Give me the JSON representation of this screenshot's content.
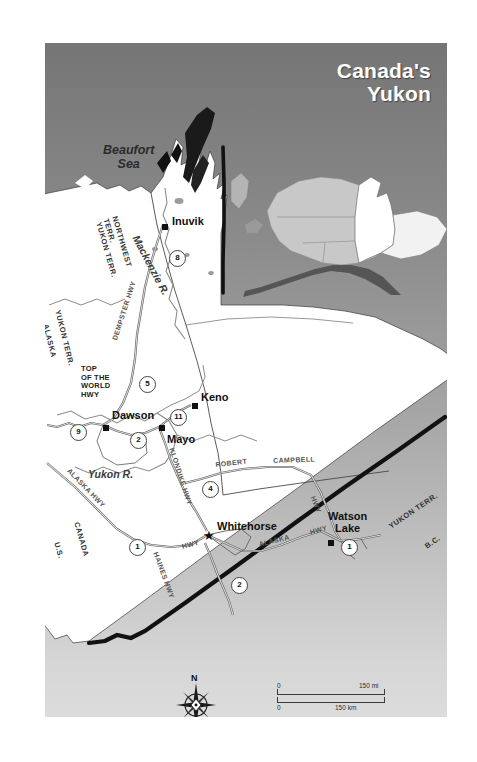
{
  "title": "Canada's\nYukon",
  "map": {
    "water_labels": [
      {
        "name": "beaufort-sea",
        "text": "Beaufort\nSea",
        "x": 58,
        "y": 100
      },
      {
        "name": "yukon-river",
        "text": "Yukon R.",
        "x": 43,
        "y": 425
      },
      {
        "name": "mackenzie-river",
        "text": "Mackenzie R.",
        "x": 96,
        "y": 190
      }
    ],
    "cities": [
      {
        "name": "inuvik",
        "label": "Inuvik",
        "marker": "square",
        "lx": 122,
        "ly": 165,
        "mx": 117,
        "my": 181
      },
      {
        "name": "dawson",
        "label": "Dawson",
        "marker": "square",
        "lx": 62,
        "ly": 366,
        "mx": 58,
        "my": 382
      },
      {
        "name": "keno",
        "label": "Keno",
        "marker": "square",
        "lx": 152,
        "ly": 352,
        "mx": 147,
        "my": 360
      },
      {
        "name": "mayo",
        "label": "Mayo",
        "marker": "square",
        "lx": 131,
        "ly": 391,
        "mx": 114,
        "my": 382
      },
      {
        "name": "whitehorse",
        "label": "Whitehorse",
        "marker": "star",
        "lx": 178,
        "ly": 484,
        "mx": 164,
        "my": 492
      },
      {
        "name": "watson-lake",
        "label": "Watson\nLake",
        "marker": "square",
        "lx": 288,
        "ly": 473,
        "mx": 283,
        "my": 497
      }
    ],
    "highway_labels": [
      {
        "name": "dempster-hwy",
        "text": "DEMPSTER HWY",
        "x": 68,
        "y": 300,
        "rot": -72
      },
      {
        "name": "top-of-the-world-hwy",
        "text": "TOP\nOF THE\nWORLD\nHWY",
        "x": 38,
        "y": 325,
        "rot": 0
      },
      {
        "name": "klondike-hwy",
        "text": "KLONDIKE HWY",
        "x": 136,
        "y": 430,
        "rot": 72
      },
      {
        "name": "alaska-hwy-west",
        "text": "ALASKA HWY",
        "x": 30,
        "y": 470,
        "rot": 52
      },
      {
        "name": "haines-hwy",
        "text": "HAINES HWY",
        "x": 119,
        "y": 516,
        "rot": 74
      },
      {
        "name": "robert-hwy",
        "text": "ROBERT",
        "x": 180,
        "y": 422,
        "rot": -8
      },
      {
        "name": "campbell-hwy",
        "text": "CAMPBELL",
        "x": 238,
        "y": 421,
        "rot": -4
      },
      {
        "name": "campbell-hwy-tail",
        "text": "HWY",
        "x": 272,
        "y": 470,
        "rot": 68
      },
      {
        "name": "alaska-hwy-south",
        "text": "ALASKA",
        "x": 217,
        "y": 503,
        "rot": 14
      },
      {
        "name": "alaska-hwy-east",
        "text": "HWY",
        "x": 266,
        "y": 489,
        "rot": 20
      },
      {
        "name": "alaska-hwy-whitehorse",
        "text": "HWY",
        "x": 139,
        "y": 503,
        "rot": 16
      }
    ],
    "border_labels": [
      {
        "name": "alaska-border",
        "text": "ALASKA",
        "x": 5,
        "y": 282,
        "rot": 74
      },
      {
        "name": "yukon-terr-west",
        "text": "YUKON TERR.",
        "x": 18,
        "y": 270,
        "rot": 74
      },
      {
        "name": "northwest-terr",
        "text": "NORTHWEST\nTERR.",
        "x": 73,
        "y": 175,
        "rot": 74
      },
      {
        "name": "yukon-terr-north",
        "text": "YUKON TERR.",
        "x": 58,
        "y": 180,
        "rot": 74
      },
      {
        "name": "us-border",
        "text": "U.S.",
        "x": 17,
        "y": 500,
        "rot": 74
      },
      {
        "name": "canada-border",
        "text": "CANADA",
        "x": 38,
        "y": 483,
        "rot": 74
      },
      {
        "name": "yukon-terr-southeast",
        "text": "YUKON TERR.",
        "x": 346,
        "y": 478,
        "rot": 16
      },
      {
        "name": "bc-border",
        "text": "B.C.",
        "x": 383,
        "y": 497,
        "rot": 16
      }
    ],
    "highway_shields": [
      {
        "name": "shield-8",
        "number": "8",
        "x": 124,
        "y": 207
      },
      {
        "name": "shield-5",
        "number": "5",
        "x": 94,
        "y": 333
      },
      {
        "name": "shield-9",
        "number": "9",
        "x": 25,
        "y": 381
      },
      {
        "name": "shield-2-dawson",
        "number": "2",
        "x": 85,
        "y": 389
      },
      {
        "name": "shield-11",
        "number": "11",
        "x": 125,
        "y": 366
      },
      {
        "name": "shield-4",
        "number": "4",
        "x": 157,
        "y": 438
      },
      {
        "name": "shield-1-alaska",
        "number": "1",
        "x": 84,
        "y": 496
      },
      {
        "name": "shield-2-haines",
        "number": "2",
        "x": 186,
        "y": 534
      },
      {
        "name": "shield-1-watson",
        "number": "1",
        "x": 296,
        "y": 496
      }
    ]
  },
  "inset": {
    "name": "alaska-yukon-locator"
  },
  "compass": {
    "north_label": "N"
  },
  "scale": {
    "miles_zero": "0",
    "miles_max": "150 mi",
    "km_zero": "0",
    "km_max": "150 km"
  },
  "colors": {
    "panel_top": "#757575",
    "panel_bottom": "#dcdcdc",
    "land": "#ffffff",
    "title_text": "#ffffff",
    "border_line": "#111111"
  }
}
